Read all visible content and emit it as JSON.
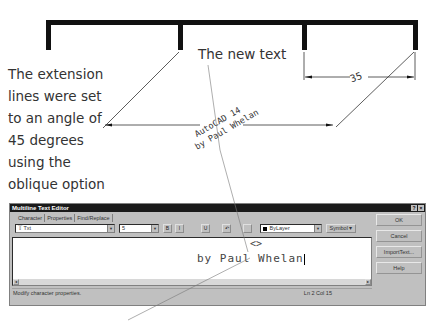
{
  "figure": {
    "caption_lines": [
      "The extension",
      "lines were set",
      "to an angle of",
      "45 degrees",
      "using the",
      "oblique option"
    ],
    "callout_label": "The new text",
    "dimension_small": "35",
    "dimension_large_text": {
      "line1": "AutoCAD 14",
      "line2": "by Paul Whelan"
    }
  },
  "dialog": {
    "title": "Multiline Text Editor",
    "title_buttons": [
      "?",
      "×"
    ],
    "tabs": [
      {
        "label": "Character",
        "active": true
      },
      {
        "label": "Properties",
        "active": false
      },
      {
        "label": "Find/Replace",
        "active": false
      }
    ],
    "toolbar": {
      "font": "Txt",
      "font_icon": "truetype-icon",
      "height": "5",
      "bold": "B",
      "italic": "I",
      "underline": "U",
      "undo": "↶",
      "stack": "a/b",
      "color": "ByLayer",
      "color_value": "#000000",
      "symbol_label": "Symbol"
    },
    "editor": {
      "line1": "<>",
      "line2": "by Paul Whelan"
    },
    "buttons": {
      "ok": "OK",
      "cancel": "Cancel",
      "import": "ImportText...",
      "help": "Help"
    },
    "status": {
      "message": "Modify character properties.",
      "position": "Ln 2 Col 15"
    }
  }
}
